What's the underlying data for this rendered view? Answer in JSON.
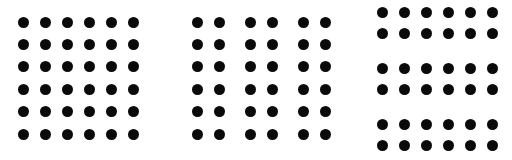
{
  "figure": {
    "width": 512,
    "height": 160,
    "background_color": "#ffffff",
    "dot_color": "#0a0a0a",
    "dot_diameter": 11,
    "panel_count": 3
  },
  "chart_data": {
    "type": "scatter",
    "subtitle": "",
    "xlabel": "",
    "ylabel": "",
    "grid": false,
    "legend_position": "none",
    "xlim": [
      0,
      512
    ],
    "ylim": [
      0,
      160
    ],
    "marker": "filled-circle",
    "marker_color": "#0a0a0a",
    "marker_size": 11,
    "series": [
      {
        "name": "Panel 1 — uniform grid",
        "grouping": "none",
        "rows": 6,
        "columns": 6,
        "column_centers": [
          23,
          45,
          67,
          89,
          111,
          133
        ],
        "row_centers": [
          22,
          44.4,
          66.8,
          89.2,
          111.6,
          134
        ],
        "column_spacing": 22,
        "row_spacing": 22.4,
        "point_count": 36
      },
      {
        "name": "Panel 2 — grouped into column pairs",
        "grouping": "columns",
        "rows": 6,
        "columns": 6,
        "column_centers": [
          197,
          219,
          250,
          272,
          303,
          325
        ],
        "row_centers": [
          22,
          44.4,
          66.8,
          89.2,
          111.6,
          134
        ],
        "within_pair_column_spacing": 22,
        "between_pair_column_gap": 31,
        "row_spacing": 22.4,
        "point_count": 36
      },
      {
        "name": "Panel 3 — grouped into row pairs",
        "grouping": "rows",
        "rows": 6,
        "columns": 6,
        "column_centers": [
          382,
          404,
          426,
          448,
          470,
          492
        ],
        "row_centers": [
          12,
          33,
          68,
          89,
          124,
          145
        ],
        "column_spacing": 22,
        "within_pair_row_spacing": 21,
        "between_pair_row_gap": 35,
        "point_count": 36
      }
    ]
  }
}
